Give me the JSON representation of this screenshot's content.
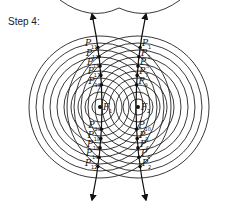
{
  "step_label": "Step 4:",
  "foci": [
    {
      "label": "F",
      "sub": "1"
    },
    {
      "label": "F",
      "sub": "2"
    }
  ],
  "left_branch_points_top": [
    {
      "label": "P",
      "sub": "11"
    },
    {
      "label": "P",
      "sub": "13"
    },
    {
      "label": "P",
      "sub": "15"
    },
    {
      "label": "P",
      "sub": "17"
    },
    {
      "label": "P",
      "sub": "19"
    }
  ],
  "left_branch_points_bottom": [
    {
      "label": "P",
      "sub": "20"
    },
    {
      "label": "P",
      "sub": "18"
    },
    {
      "label": "P",
      "sub": "16"
    },
    {
      "label": "P",
      "sub": "14"
    },
    {
      "label": "P",
      "sub": "12"
    }
  ],
  "right_branch_points_top": [
    {
      "label": "P",
      "sub": "1"
    },
    {
      "label": "P",
      "sub": "3"
    },
    {
      "label": "P",
      "sub": "5"
    },
    {
      "label": "P",
      "sub": "7"
    },
    {
      "label": "P",
      "sub": "9"
    }
  ],
  "right_branch_points_bottom": [
    {
      "label": "P",
      "sub": "10"
    },
    {
      "label": "P",
      "sub": "8"
    },
    {
      "label": "P",
      "sub": "6"
    },
    {
      "label": "P",
      "sub": "4"
    },
    {
      "label": "P",
      "sub": "2"
    }
  ]
}
